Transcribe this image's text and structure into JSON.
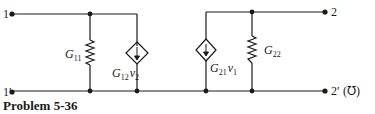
{
  "figure": {
    "caption": "Problem 5-36",
    "unit_label": "(℧)"
  },
  "terminals": {
    "t1": "1",
    "t1p": "1′",
    "t2": "2",
    "t2p": "2′"
  },
  "components": {
    "g11": {
      "symbol": "G",
      "sub": "11",
      "type": "resistor"
    },
    "g12": {
      "symbol": "G",
      "sub": "12",
      "var": "v",
      "var_sub": "2",
      "type": "dependent-current-source"
    },
    "g21": {
      "symbol": "G",
      "sub": "21",
      "var": "v",
      "var_sub": "1",
      "type": "dependent-current-source"
    },
    "g22": {
      "symbol": "G",
      "sub": "22",
      "type": "resistor"
    }
  },
  "colors": {
    "wire": "#1a1a1a",
    "background": "#ffffff"
  }
}
